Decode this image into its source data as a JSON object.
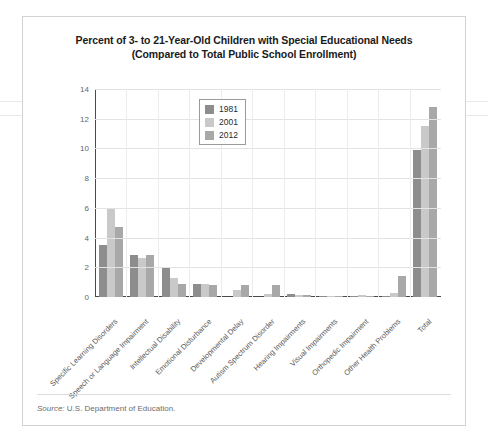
{
  "figure": {
    "title_line1": "Percent of 3- to 21-Year-Old Children with Special Educational Needs",
    "title_line2": "(Compared to Total Public School Enrollment)",
    "source_label": "Source:",
    "source_text": "U.S. Department of Education."
  },
  "legend": {
    "position": "top-center-inside",
    "entries": [
      {
        "label": "1981",
        "color": "#8d8d8d"
      },
      {
        "label": "2001",
        "color": "#c9c9c9"
      },
      {
        "label": "2012",
        "color": "#a8a8a8"
      }
    ]
  },
  "chart_data": {
    "type": "bar",
    "title": "Percent of 3- to 21-Year-Old Children with Special Educational Needs (Compared to Total Public School Enrollment)",
    "xlabel": "",
    "ylabel": "",
    "ylim": [
      0,
      14
    ],
    "yticks": [
      0,
      2,
      4,
      6,
      8,
      10,
      12,
      14
    ],
    "ytick_labels": [
      "0",
      "2",
      "4",
      "6",
      "8",
      "10",
      "12",
      "14"
    ],
    "grid": true,
    "legend_position": "upper center",
    "categories": [
      "Specific Learning Disorders",
      "Speech or Language Impairment",
      "Intellectual Disability",
      "Emotional Disturbance",
      "Developmental Delay",
      "Autism Spectrum Disorder",
      "Hearing Impairments",
      "Visual Impairments",
      "Orthopedic Impairment",
      "Other Health Problems",
      "Total"
    ],
    "series": [
      {
        "name": "1981",
        "color": "#8d8d8d",
        "values": [
          3.5,
          2.8,
          2.0,
          0.9,
          0.0,
          0.0,
          0.2,
          0.1,
          0.1,
          0.1,
          9.9
        ]
      },
      {
        "name": "2001",
        "color": "#c9c9c9",
        "values": [
          6.0,
          2.6,
          1.3,
          0.9,
          0.5,
          0.2,
          0.15,
          0.06,
          0.15,
          0.3,
          11.5
        ]
      },
      {
        "name": "2012",
        "color": "#a8a8a8",
        "values": [
          4.7,
          2.8,
          0.9,
          0.8,
          0.8,
          0.8,
          0.15,
          0.06,
          0.1,
          1.4,
          12.8
        ]
      }
    ]
  }
}
